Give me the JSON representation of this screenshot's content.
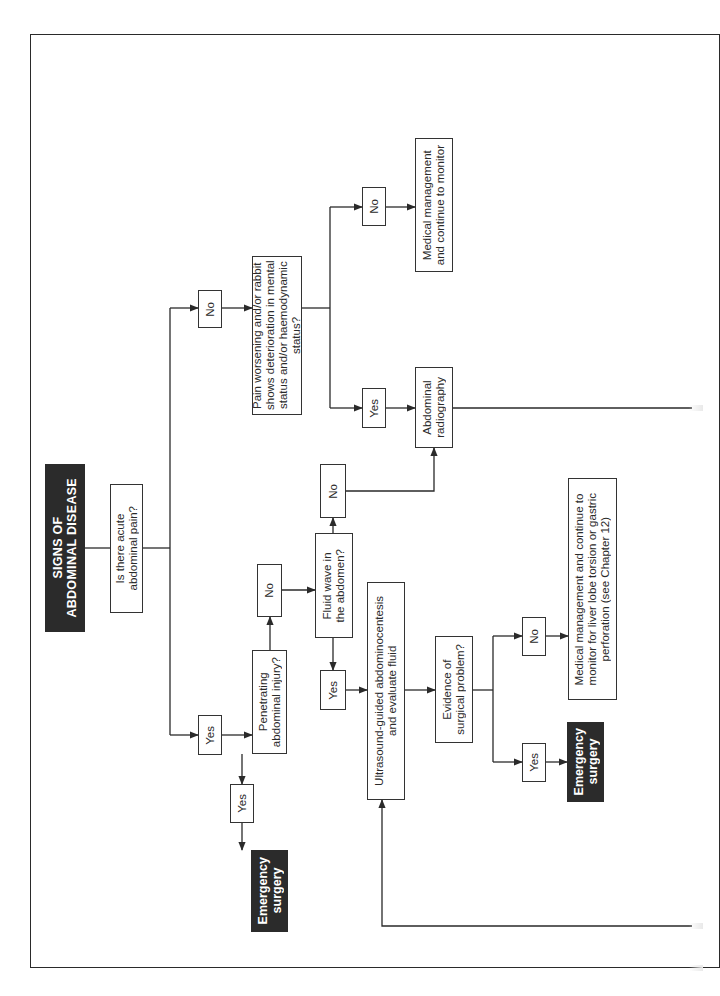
{
  "diagram": {
    "title": "SIGNS OF\nABDOMINAL DISEASE",
    "orientation": "rotated 90° counter-clockwise (read bottom-to-top)",
    "nodes": {
      "q_acute_pain": "Is there acute\nabdominal pain?",
      "lbl_no_pain": "No",
      "q_pain_worsening": "Pain worsening and/or rabbit\nshows deterioration in mental\nstatus and/or haemodynamic status?",
      "lbl_no_worsening": "No",
      "medical_monitor": "Medical management\nand continue to monitor",
      "lbl_yes_worsening": "Yes",
      "abdominal_radiography": "Abdominal\nradiography",
      "lbl_yes_pain": "Yes",
      "q_penetrating": "Penetrating\nabdominal injury?",
      "lbl_yes_penetrating": "Yes",
      "emergency_surgery_1": "Emergency\nsurgery",
      "lbl_no_penetrating": "No",
      "q_fluid_wave": "Fluid wave in\nthe abdomen?",
      "lbl_no_fluid": "No",
      "lbl_yes_fluid": "Yes",
      "ultrasound": "Ultrasound-guided abdominocentesis\nand evaluate fluid",
      "q_surgical_problem": "Evidence of\nsurgical problem?",
      "lbl_no_surgical": "No",
      "medical_liver": "Medical management and continue to\nmonitor for liver lobe torsion or gastric\nperforation (see Chapter 12)",
      "lbl_yes_surgical": "Yes",
      "emergency_surgery_2": "Emergency\nsurgery"
    },
    "edges": [
      [
        "title",
        "q_acute_pain"
      ],
      [
        "q_acute_pain",
        "lbl_no_pain"
      ],
      [
        "lbl_no_pain",
        "q_pain_worsening"
      ],
      [
        "q_pain_worsening",
        "lbl_no_worsening"
      ],
      [
        "lbl_no_worsening",
        "medical_monitor"
      ],
      [
        "q_pain_worsening",
        "lbl_yes_worsening"
      ],
      [
        "lbl_yes_worsening",
        "abdominal_radiography"
      ],
      [
        "abdominal_radiography",
        "(continues off page)"
      ],
      [
        "q_acute_pain",
        "lbl_yes_pain"
      ],
      [
        "lbl_yes_pain",
        "q_penetrating"
      ],
      [
        "q_penetrating",
        "lbl_yes_penetrating"
      ],
      [
        "lbl_yes_penetrating",
        "emergency_surgery_1"
      ],
      [
        "q_penetrating",
        "lbl_no_penetrating"
      ],
      [
        "lbl_no_penetrating",
        "q_fluid_wave"
      ],
      [
        "q_fluid_wave",
        "lbl_no_fluid"
      ],
      [
        "lbl_no_fluid",
        "abdominal_radiography"
      ],
      [
        "q_fluid_wave",
        "lbl_yes_fluid"
      ],
      [
        "lbl_yes_fluid",
        "ultrasound"
      ],
      [
        "(from off page)",
        "ultrasound"
      ],
      [
        "ultrasound",
        "q_surgical_problem"
      ],
      [
        "q_surgical_problem",
        "lbl_no_surgical"
      ],
      [
        "lbl_no_surgical",
        "medical_liver"
      ],
      [
        "q_surgical_problem",
        "lbl_yes_surgical"
      ],
      [
        "lbl_yes_surgical",
        "emergency_surgery_2"
      ]
    ],
    "colors": {
      "line": "#2a2a2a",
      "dark_box": "#2b2b2b",
      "dark_text": "#ffffff",
      "background": "#ffffff"
    }
  }
}
